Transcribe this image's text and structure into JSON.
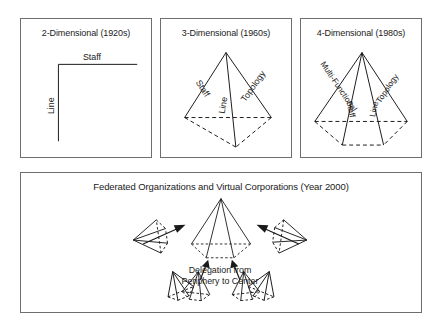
{
  "figure": {
    "panels": [
      {
        "id": "two-dimensional",
        "title": "2-Dimensional (1920s)",
        "labels": {
          "staff": "Staff",
          "line": "Line"
        }
      },
      {
        "id": "three-dimensional",
        "title": "3-Dimensional (1960s)",
        "labels": {
          "staff": "Staff",
          "topology": "Topology",
          "line": "Line"
        }
      },
      {
        "id": "four-dimensional",
        "title": "4-Dimensional (1980s)",
        "labels": {
          "multi_functional": "Multi-Functional",
          "topology": "Topology",
          "staff": "Staff",
          "line": "Line"
        }
      },
      {
        "id": "federated-organizations",
        "title": "Federated Organizations and Virtual Corporations (Year 2000)",
        "labels": {
          "delegation_line1": "Delegation from",
          "delegation_line2": "Periphery to Center"
        }
      }
    ],
    "colors": {
      "ink": "#1a1a1a",
      "panel_border": "#6e6e6e",
      "background": "#ffffff"
    }
  }
}
